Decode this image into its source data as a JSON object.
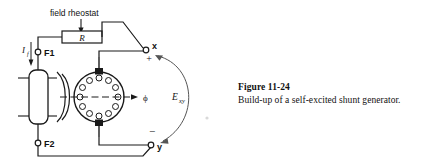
{
  "figure": {
    "caption_title": "Figure 11-24",
    "caption_body": "Build-up of a self-excited shunt generator."
  },
  "diagram": {
    "type": "electrical-schematic",
    "labels": {
      "field_rheostat": "field rheostat",
      "rheostat_symbol": "R",
      "field_current": "I",
      "field_current_sub": "f",
      "terminal_f1": "F1",
      "terminal_f2": "F2",
      "terminal_x": "x",
      "terminal_y": "y",
      "polarity_positive": "+",
      "polarity_negative": "−",
      "flux_symbol": "ϕ",
      "emf_symbol": "E",
      "emf_sub": "xy"
    },
    "colors": {
      "line": "#1a1a1a",
      "fill": "#ffffff",
      "background": "#ffffff"
    },
    "components": {
      "armature_conductor_count": 12,
      "brushes": 2,
      "field_coil": 1,
      "pole_pieces": 2
    }
  }
}
